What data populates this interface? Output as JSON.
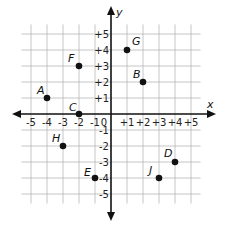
{
  "chart_data": {
    "type": "scatter",
    "title": "",
    "xlabel": "x",
    "ylabel": "y",
    "xlim": [
      -5,
      5
    ],
    "ylim": [
      -5,
      5
    ],
    "grid": true,
    "origin_label": "0",
    "x_ticks": [
      "-5",
      "-4",
      "-3",
      "-2",
      "-1",
      "+1",
      "+2",
      "+3",
      "+4",
      "+5"
    ],
    "y_ticks": [
      "+5",
      "+4",
      "+3",
      "+2",
      "+1",
      "-1",
      "-2",
      "-3",
      "-4",
      "-5"
    ],
    "points": [
      {
        "label": "A",
        "x": -4,
        "y": 1
      },
      {
        "label": "B",
        "x": 2,
        "y": 2
      },
      {
        "label": "C",
        "x": -2,
        "y": 0
      },
      {
        "label": "D",
        "x": 4,
        "y": -3
      },
      {
        "label": "E",
        "x": -1,
        "y": -4
      },
      {
        "label": "F",
        "x": -2,
        "y": 3
      },
      {
        "label": "G",
        "x": 1,
        "y": 4
      },
      {
        "label": "H",
        "x": -3,
        "y": -2
      },
      {
        "label": "J",
        "x": 3,
        "y": -4
      }
    ]
  }
}
